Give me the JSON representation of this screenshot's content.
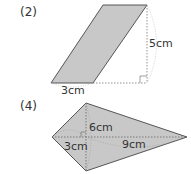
{
  "figures": [
    {
      "id": "2",
      "label": "(2)",
      "shape": "parallelogram",
      "dimensions": {
        "base": "3cm",
        "height": "5cm"
      }
    },
    {
      "id": "4",
      "label": "(4)",
      "shape": "kite",
      "dimensions": {
        "vertical_diagonal": "6cm",
        "left_segment": "3cm",
        "right_segment": "9cm"
      }
    }
  ],
  "colors": {
    "fill": "#c8c8c8",
    "stroke": "#555555",
    "dotted": "#777777",
    "text": "#333333"
  }
}
